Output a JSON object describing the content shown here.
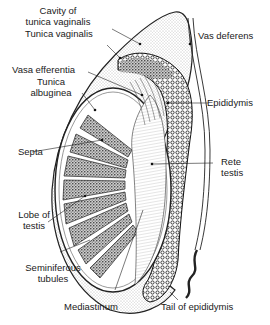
{
  "figure": {
    "colors": {
      "ink": "#1a1a1a",
      "stipple": "#cfcfcf",
      "background": "#ffffff"
    }
  },
  "labels": {
    "cavity_tunica_vaginalis": {
      "line1": "Cavity of",
      "line2": "tunica vaginalis"
    },
    "tunica_vaginalis": "Tunica vaginalis",
    "vasa_efferentia": "Vasa efferentia",
    "tunica_albuginea": {
      "line1": "Tunica",
      "line2": "albuginea"
    },
    "septa": "Septa",
    "lobe_of_testis": {
      "line1": "Lobe of",
      "line2": "testis"
    },
    "seminiferous_tubules": {
      "line1": "Seminiferous",
      "line2": "tubules"
    },
    "mediastinum": "Mediastinum",
    "vas_deferens": "Vas deferens",
    "epididymis": "Epididymis",
    "rete_testis": {
      "line1": "Rete",
      "line2": "testis"
    },
    "tail_of_epididymis": "Tail of epididymis"
  }
}
